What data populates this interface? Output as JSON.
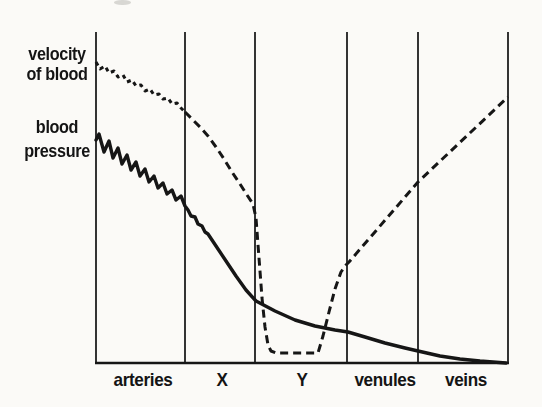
{
  "figure": {
    "background_color": "#fbfaf7",
    "line_color": "#161616",
    "grid_line_color": "#1d1d1d"
  },
  "chart_data": {
    "type": "line",
    "title": "",
    "x_categories": [
      "arteries",
      "X",
      "Y",
      "venules",
      "veins"
    ],
    "x_label_centers_px": [
      143,
      222,
      302,
      385,
      466
    ],
    "x_boundaries_px": [
      96,
      185,
      255,
      347,
      418,
      508
    ],
    "plot_top_px": 32,
    "axis_y_px": 363,
    "grid_stroke_width": 1.8,
    "axis_stroke_width": 2.6,
    "axis_labels": {
      "velocity": {
        "lines": [
          "velocity",
          "of blood"
        ]
      },
      "pressure": {
        "lines": [
          "blood",
          "pressure"
        ]
      }
    },
    "legend_position": "left-axis-stacked",
    "grid": "vertical-region-dividers-only",
    "series": [
      {
        "name": "velocity of blood",
        "style": "dashed",
        "color": "#161616",
        "stroke_width": 3,
        "segments": [
          {
            "dash": "4 4",
            "points": [
              [
                96,
                62
              ],
              [
                100,
                69
              ],
              [
                105,
                66
              ],
              [
                109,
                73
              ],
              [
                114,
                71
              ],
              [
                118,
                77
              ],
              [
                123,
                75
              ],
              [
                127,
                82
              ],
              [
                132,
                80
              ],
              [
                136,
                86
              ],
              [
                141,
                85
              ],
              [
                145,
                91
              ],
              [
                150,
                89
              ],
              [
                154,
                95
              ],
              [
                159,
                94
              ],
              [
                163,
                99
              ],
              [
                168,
                98
              ],
              [
                172,
                104
              ],
              [
                177,
                103
              ],
              [
                181,
                108
              ],
              [
                185,
                112
              ]
            ]
          },
          {
            "dash": "8 5",
            "points": [
              [
                185,
                112
              ],
              [
                192,
                119
              ],
              [
                200,
                127
              ],
              [
                208,
                136
              ],
              [
                216,
                147
              ],
              [
                224,
                159
              ],
              [
                232,
                172
              ],
              [
                240,
                184
              ],
              [
                247,
                195
              ],
              [
                253,
                204
              ],
              [
                256,
                218
              ],
              [
                259,
                258
              ],
              [
                262,
                298
              ],
              [
                265,
                327
              ],
              [
                268,
                345
              ],
              [
                271,
                351
              ],
              [
                276,
                353
              ],
              [
                318,
                353
              ],
              [
                323,
                336
              ],
              [
                329,
                312
              ],
              [
                335,
                289
              ],
              [
                341,
                272
              ],
              [
                346,
                265
              ],
              [
                349,
                262
              ],
              [
                418,
                182
              ],
              [
                508,
                97
              ]
            ]
          }
        ]
      },
      {
        "name": "blood pressure",
        "style": "solid",
        "color": "#161616",
        "stroke_width": 3.4,
        "segments": [
          {
            "dash": null,
            "points": [
              [
                96,
                140
              ],
              [
                99,
                134
              ],
              [
                104,
                152
              ],
              [
                109,
                141
              ],
              [
                113,
                158
              ],
              [
                118,
                148
              ],
              [
                122,
                164
              ],
              [
                127,
                155
              ],
              [
                131,
                170
              ],
              [
                136,
                162
              ],
              [
                140,
                176
              ],
              [
                145,
                169
              ],
              [
                149,
                182
              ],
              [
                154,
                176
              ],
              [
                158,
                188
              ],
              [
                163,
                183
              ],
              [
                167,
                194
              ],
              [
                172,
                190
              ],
              [
                176,
                200
              ],
              [
                181,
                196
              ],
              [
                185,
                206
              ],
              [
                188,
                210
              ],
              [
                191,
                216
              ],
              [
                195,
                217
              ],
              [
                198,
                224
              ],
              [
                202,
                226
              ],
              [
                205,
                232
              ],
              [
                208,
                234
              ],
              [
                216,
                246
              ],
              [
                226,
                261
              ],
              [
                236,
                276
              ],
              [
                246,
                290
              ],
              [
                256,
                301
              ],
              [
                275,
                311
              ],
              [
                295,
                320
              ],
              [
                315,
                326
              ],
              [
                335,
                330
              ],
              [
                348,
                332
              ],
              [
                365,
                337
              ],
              [
                385,
                343
              ],
              [
                405,
                348
              ],
              [
                418,
                351
              ],
              [
                440,
                356
              ],
              [
                460,
                359
              ],
              [
                480,
                361
              ],
              [
                506,
                363
              ]
            ]
          }
        ]
      }
    ]
  }
}
